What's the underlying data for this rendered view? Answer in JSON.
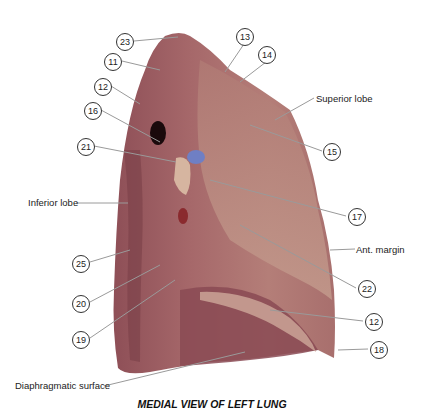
{
  "figure": {
    "title": "MEDIAL VIEW OF LEFT LUNG",
    "colors": {
      "lung_base": "#a8676a",
      "lung_dark": "#7a3f48",
      "lung_light": "#c28f86",
      "hilum_blue": "#6f7fc4",
      "leader_line": "#9a9a9a"
    },
    "numbered_labels": [
      {
        "id": "23",
        "x": 116,
        "y": 33
      },
      {
        "id": "11",
        "x": 104,
        "y": 53
      },
      {
        "id": "12",
        "x": 94,
        "y": 78
      },
      {
        "id": "16",
        "x": 84,
        "y": 102
      },
      {
        "id": "21",
        "x": 77,
        "y": 138
      },
      {
        "id": "13",
        "x": 236,
        "y": 28
      },
      {
        "id": "14",
        "x": 258,
        "y": 46
      },
      {
        "id": "15",
        "x": 323,
        "y": 143
      },
      {
        "id": "17",
        "x": 348,
        "y": 208
      },
      {
        "id": "22",
        "x": 358,
        "y": 280
      },
      {
        "id": "12",
        "x": 365,
        "y": 313
      },
      {
        "id": "18",
        "x": 370,
        "y": 341
      },
      {
        "id": "25",
        "x": 72,
        "y": 255
      },
      {
        "id": "20",
        "x": 72,
        "y": 295
      },
      {
        "id": "19",
        "x": 72,
        "y": 331
      }
    ],
    "text_labels": [
      {
        "text": "Superior lobe",
        "x": 316,
        "y": 94
      },
      {
        "text": "Inferior lobe",
        "x": 28,
        "y": 198
      },
      {
        "text": "Ant. margin",
        "x": 356,
        "y": 248
      },
      {
        "text": "Diaphragmatic surface",
        "x": 15,
        "y": 381
      }
    ]
  }
}
